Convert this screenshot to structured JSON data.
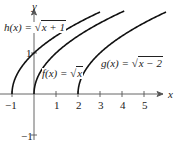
{
  "chart_data": {
    "type": "line",
    "title": "",
    "xlabel": "x",
    "ylabel": "y",
    "xlim": [
      -1,
      6
    ],
    "ylim": [
      -1,
      2.1
    ],
    "x_ticks": [
      -1,
      1,
      2,
      3,
      4,
      5
    ],
    "x_tick_labels": [
      "−1",
      "1",
      "2",
      "3",
      "4",
      "5"
    ],
    "y_ticks": [
      1,
      -1
    ],
    "y_tick_labels": [
      "1",
      "−1"
    ],
    "grid": false,
    "series": [
      {
        "name": "h(x) = √(x + 1)",
        "label_fn": "h(x) = ",
        "label_radicand": "x + 1",
        "domain": [
          -1,
          3
        ],
        "points": [
          [
            -1,
            0
          ],
          [
            0,
            1
          ],
          [
            1,
            1.414
          ],
          [
            2,
            1.732
          ],
          [
            3,
            2
          ]
        ]
      },
      {
        "name": "f(x) = √x",
        "label_fn": "f(x) = ",
        "label_radicand": "x",
        "domain": [
          0,
          4.1
        ],
        "points": [
          [
            0,
            0
          ],
          [
            1,
            1
          ],
          [
            2,
            1.414
          ],
          [
            3,
            1.732
          ],
          [
            4,
            2
          ]
        ]
      },
      {
        "name": "g(x) = √(x − 2)",
        "label_fn": "g(x) = ",
        "label_radicand": "x − 2",
        "domain": [
          2,
          6
        ],
        "points": [
          [
            2,
            0
          ],
          [
            3,
            1
          ],
          [
            4,
            1.414
          ],
          [
            5,
            1.732
          ],
          [
            6,
            2
          ]
        ]
      }
    ],
    "colors": {
      "curve": "#111111",
      "axis": "#555555"
    }
  }
}
